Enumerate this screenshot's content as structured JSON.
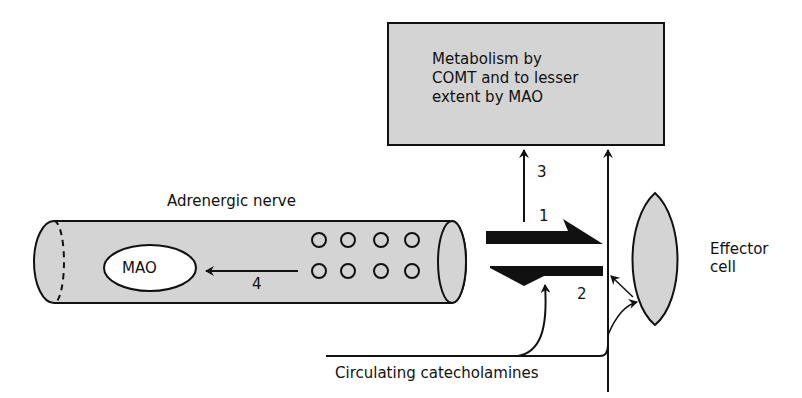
{
  "diagram": {
    "metabolism_box": {
      "lines": [
        "Metabolism by",
        "COMT and to lesser",
        "extent by MAO"
      ],
      "fill": "#d4d4d4"
    },
    "nerve": {
      "label": "Adrenergic nerve",
      "enzyme_label": "MAO",
      "fill": "#d4d4d4",
      "vesicle_rows": 2,
      "vesicles_per_row": 4
    },
    "effector": {
      "label_lines": [
        "Effector",
        "cell"
      ],
      "fill": "#d4d4d4"
    },
    "pathways": [
      {
        "number": "1",
        "description": "release from nerve to effector"
      },
      {
        "number": "2",
        "description": "reuptake into nerve"
      },
      {
        "number": "3",
        "description": "diffusion to metabolism"
      },
      {
        "number": "4",
        "description": "intraneuronal metabolism by MAO"
      }
    ],
    "source_label": "Circulating catecholamines",
    "stroke_color": "#111111"
  }
}
